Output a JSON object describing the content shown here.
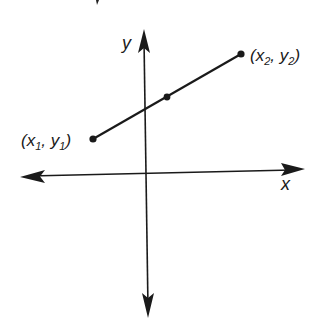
{
  "diagram": {
    "type": "coordinate-plane-line-segment",
    "axes": {
      "x_label": "x",
      "y_label": "y"
    },
    "points": [
      {
        "id": "p1",
        "label": "(x1, y1)",
        "var_x": "x",
        "sub_x": "1",
        "var_y": "y",
        "sub_y": "1"
      },
      {
        "id": "mid",
        "label": ""
      },
      {
        "id": "p2",
        "label": "(x2, y2)",
        "var_x": "x",
        "sub_x": "2",
        "var_y": "y",
        "sub_y": "2"
      }
    ],
    "colors": {
      "ink": "#1a1a1a",
      "background": "#ffffff"
    }
  }
}
